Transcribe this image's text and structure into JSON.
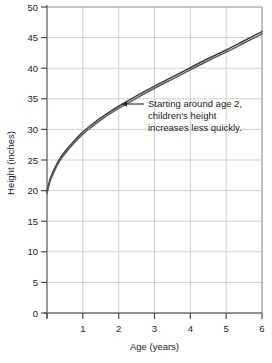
{
  "chart_data": {
    "type": "line",
    "title": "",
    "xlabel": "Age (years)",
    "ylabel": "Height (inches)",
    "xlim": [
      0,
      6
    ],
    "ylim": [
      0,
      50
    ],
    "xticks": [
      0,
      1,
      2,
      3,
      4,
      5,
      6
    ],
    "xtick_labels": [
      "",
      "1",
      "2",
      "3",
      "4",
      "5",
      "6"
    ],
    "yticks": [
      0,
      5,
      10,
      15,
      20,
      25,
      30,
      35,
      40,
      45,
      50
    ],
    "ytick_labels": [
      "0",
      "5",
      "10",
      "15",
      "20",
      "25",
      "30",
      "35",
      "40",
      "45",
      "50"
    ],
    "grid": true,
    "legend": "none",
    "series": [
      {
        "name": "Children's height",
        "color": "#4d4d4d",
        "x": [
          0.0,
          0.08,
          0.17,
          0.25,
          0.33,
          0.5,
          0.75,
          1.0,
          1.25,
          1.5,
          1.75,
          2.0,
          2.5,
          3.0,
          3.5,
          4.0,
          4.5,
          5.0,
          5.5,
          6.0
        ],
        "y": [
          19.7,
          21.6,
          22.9,
          23.9,
          24.8,
          26.2,
          27.9,
          29.4,
          30.6,
          31.7,
          32.7,
          33.6,
          35.3,
          36.9,
          38.4,
          39.9,
          41.4,
          42.8,
          44.3,
          45.8
        ]
      }
    ],
    "annotations": [
      {
        "name": "curve-callout",
        "lines": [
          "Starting around age 2,",
          "children's height",
          "increases less quickly."
        ],
        "arrow_target_x": 2.05,
        "arrow_target_y": 33.9
      }
    ]
  },
  "colors": {
    "background": "#ffffff",
    "grid": "#c9c9c9",
    "axis": "#6e6e6e",
    "curve": "#4d4d4d",
    "text": "#1c1c1c"
  }
}
